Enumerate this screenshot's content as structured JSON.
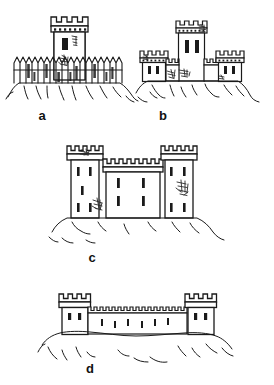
{
  "figure": {
    "background_color": "#ffffff",
    "ink_color": "#1a1a1a",
    "panel_count": 4
  },
  "panels": [
    {
      "id": "a",
      "label": "a",
      "label_x": 42,
      "label_y": 120,
      "caption": "Single keep tower enclosed by a timber palisade on a hill",
      "structures": [
        "keep-tower",
        "timber-palisade",
        "hill-terrain"
      ],
      "tower": {
        "x": 52,
        "y": 17,
        "width": 38,
        "height": 62,
        "merlon_count": 4,
        "machicolation_dots": 7,
        "window_count": 1
      },
      "palisade": {
        "x": 14,
        "y": 57,
        "width": 110,
        "height": 26,
        "stake_count": 19
      },
      "hill": {
        "baseline_y": 83
      }
    },
    {
      "id": "b",
      "label": "b",
      "label_x": 163,
      "label_y": 120,
      "caption": "Central donjon flanked by two corner towers joined by crenellated curtain walls",
      "structures": [
        "central-keep",
        "left-corner-tower",
        "right-corner-tower",
        "curtain-wall-left",
        "curtain-wall-right",
        "hill-terrain"
      ],
      "central_tower": {
        "x": 176,
        "y": 21,
        "width": 32,
        "height": 58,
        "merlon_count": 4,
        "window_count": 2
      },
      "left_tower": {
        "x": 140,
        "y": 51,
        "width": 28,
        "height": 30,
        "merlon_count": 4,
        "window_count": 2
      },
      "right_tower": {
        "x": 216,
        "y": 51,
        "width": 28,
        "height": 30,
        "merlon_count": 4,
        "window_count": 2
      },
      "curtain_wall": {
        "top_y": 59,
        "merlon_count": 12
      },
      "hill": {
        "baseline_y": 81
      }
    },
    {
      "id": "c",
      "label": "c",
      "label_x": 92,
      "label_y": 262,
      "caption": "Two tall flanking towers with a lower central block forming a compact keep",
      "structures": [
        "left-tower",
        "central-block",
        "right-tower",
        "hill-terrain"
      ],
      "left_tower": {
        "x": 68,
        "y": 146,
        "width": 36,
        "height": 72,
        "merlon_count": 6,
        "window_count": 6
      },
      "central_block": {
        "x": 104,
        "y": 159,
        "width": 58,
        "height": 59,
        "merlon_count": 9,
        "window_count": 4
      },
      "right_tower": {
        "x": 162,
        "y": 146,
        "width": 36,
        "height": 72,
        "merlon_count": 6,
        "window_count": 6
      },
      "hill": {
        "baseline_y": 218
      }
    },
    {
      "id": "d",
      "label": "d",
      "label_x": 90,
      "label_y": 373,
      "caption": "Two corner towers linked by a long low crenellated curtain wall",
      "structures": [
        "left-corner-tower",
        "long-curtain-wall",
        "right-corner-tower",
        "hill-terrain"
      ],
      "left_tower": {
        "x": 60,
        "y": 294,
        "width": 30,
        "height": 40,
        "merlon_count": 4,
        "window_count": 2
      },
      "right_tower": {
        "x": 186,
        "y": 294,
        "width": 30,
        "height": 40,
        "merlon_count": 4,
        "window_count": 2
      },
      "curtain_wall": {
        "x": 90,
        "y": 307,
        "width": 96,
        "height": 27,
        "merlon_count": 17,
        "window_count": 6
      },
      "hill": {
        "baseline_y": 334
      }
    }
  ]
}
